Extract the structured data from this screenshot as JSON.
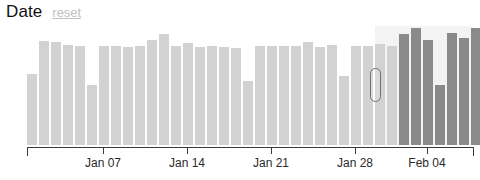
{
  "header": {
    "title": "Date",
    "reset_label": "reset",
    "reset_icon": "reset-link"
  },
  "colors": {
    "bar_unselected": "#d2d2d2",
    "bar_selected": "#8a8a8a",
    "axis": "#3a3a3a",
    "title": "#111111",
    "reset": "#c2c2c2",
    "brush_extent_bg": "#f3f3f3",
    "brush_handle_border": "#6f6f6f"
  },
  "chart_data": {
    "type": "bar",
    "title": "Date",
    "xlabel": "",
    "ylabel": "",
    "grid": false,
    "legend": "none",
    "axis_range": [
      27,
      473
    ],
    "bar_width": 10,
    "bar_pitch": 12,
    "plot_height": 119,
    "ymax": 120,
    "tick_labels": [
      "Jan 07",
      "Jan 14",
      "Jan 21",
      "Jan 28",
      "Feb 04"
    ],
    "tick_positions": [
      103,
      187,
      271,
      355,
      427
    ],
    "categories": [
      "Jan 01",
      "Jan 02",
      "Jan 03",
      "Jan 04",
      "Jan 05",
      "Jan 06",
      "Jan 07",
      "Jan 08",
      "Jan 09",
      "Jan 10",
      "Jan 11",
      "Jan 12",
      "Jan 13",
      "Jan 14",
      "Jan 15",
      "Jan 16",
      "Jan 17",
      "Jan 18",
      "Jan 19",
      "Jan 20",
      "Jan 21",
      "Jan 22",
      "Jan 23",
      "Jan 24",
      "Jan 25",
      "Jan 26",
      "Jan 27",
      "Jan 28",
      "Jan 29",
      "Jan 30",
      "Jan 31",
      "Feb 01",
      "Feb 02",
      "Feb 03",
      "Feb 04",
      "Feb 05",
      "Feb 06",
      "Feb 07"
    ],
    "values": [
      72,
      105,
      104,
      101,
      100,
      60,
      100,
      100,
      99,
      100,
      106,
      112,
      100,
      103,
      99,
      100,
      99,
      98,
      65,
      100,
      100,
      100,
      100,
      104,
      99,
      101,
      70,
      100,
      100,
      102,
      100,
      112,
      118,
      106,
      60,
      113,
      108,
      118
    ],
    "selected": [
      false,
      false,
      false,
      false,
      false,
      false,
      false,
      false,
      false,
      false,
      false,
      false,
      false,
      false,
      false,
      false,
      false,
      false,
      false,
      false,
      false,
      false,
      false,
      false,
      false,
      false,
      false,
      false,
      false,
      false,
      false,
      true,
      true,
      true,
      true,
      true,
      true,
      true
    ]
  },
  "brush": {
    "extent_start_x": 375,
    "extent_end_x": 473,
    "handle_x": 370,
    "handle_y": 42,
    "handle_name": "brush-left-handle"
  }
}
